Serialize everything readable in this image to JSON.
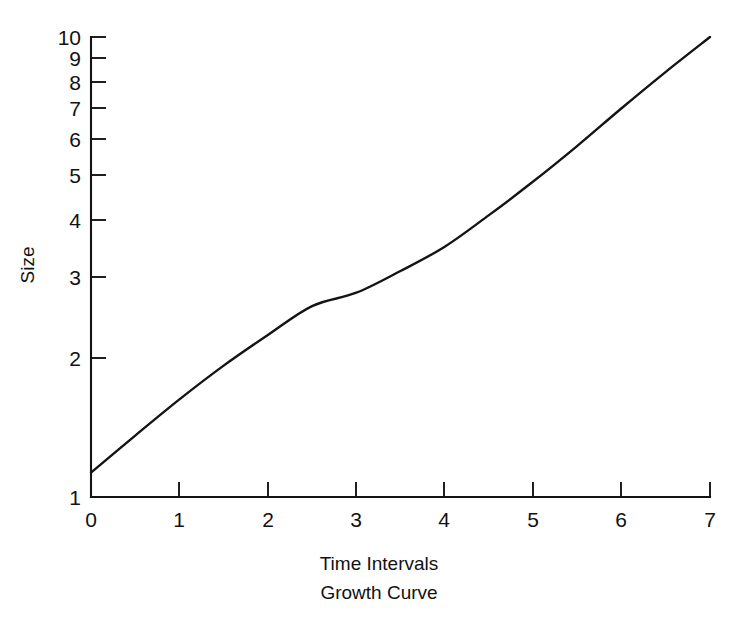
{
  "chart_data": {
    "type": "line",
    "title": "Growth Curve",
    "xlabel": "Time Intervals",
    "ylabel": "Size",
    "x_scale": "linear",
    "y_scale": "log",
    "xlim": [
      0,
      7
    ],
    "ylim": [
      1,
      10
    ],
    "grid": false,
    "legend": "none",
    "x_ticks": [
      0,
      1,
      2,
      3,
      4,
      5,
      6,
      7
    ],
    "x_tick_labels": [
      "0",
      "1",
      "2",
      "3",
      "4",
      "5",
      "6",
      "7"
    ],
    "y_ticks": [
      1,
      2,
      3,
      4,
      5,
      6,
      7,
      8,
      9,
      10
    ],
    "y_tick_labels": [
      "1",
      "2",
      "3",
      "4",
      "5",
      "6",
      "7",
      "8",
      "9",
      "10"
    ],
    "series": [
      {
        "name": "Growth",
        "x": [
          0,
          0.5,
          1,
          1.5,
          2,
          2.5,
          3,
          3.5,
          4,
          4.5,
          5,
          5.5,
          6,
          6.5,
          7
        ],
        "values": [
          1.13,
          1.36,
          1.63,
          1.93,
          2.25,
          2.6,
          2.78,
          3.1,
          3.5,
          4.1,
          4.85,
          5.8,
          7.0,
          8.4,
          10.0
        ]
      }
    ]
  },
  "axes": {
    "y_axis_label": "Size",
    "x_axis_label": "Time Intervals"
  },
  "caption": {
    "text": "Growth Curve"
  },
  "ticks": {
    "y": [
      {
        "label": "10",
        "value": 10
      },
      {
        "label": "9",
        "value": 9
      },
      {
        "label": "8",
        "value": 8
      },
      {
        "label": "7",
        "value": 7
      },
      {
        "label": "6",
        "value": 6
      },
      {
        "label": "5",
        "value": 5
      },
      {
        "label": "4",
        "value": 4
      },
      {
        "label": "3",
        "value": 3
      },
      {
        "label": "2",
        "value": 2
      },
      {
        "label": "1",
        "value": 1
      }
    ],
    "x": [
      {
        "label": "0",
        "value": 0
      },
      {
        "label": "1",
        "value": 1
      },
      {
        "label": "2",
        "value": 2
      },
      {
        "label": "3",
        "value": 3
      },
      {
        "label": "4",
        "value": 4
      },
      {
        "label": "5",
        "value": 5
      },
      {
        "label": "6",
        "value": 6
      },
      {
        "label": "7",
        "value": 7
      }
    ]
  },
  "colors": {
    "ink": "#141414",
    "background": "#ffffff"
  }
}
